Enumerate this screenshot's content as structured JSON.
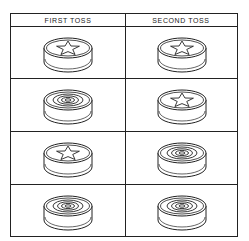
{
  "table": {
    "headers": [
      "FIRST TOSS",
      "SECOND TOSS"
    ],
    "rows": [
      {
        "first": "star",
        "second": "star"
      },
      {
        "first": "rings",
        "second": "star"
      },
      {
        "first": "star",
        "second": "rings"
      },
      {
        "first": "rings",
        "second": "rings"
      }
    ]
  },
  "colors": {
    "line": "#222222",
    "background": "#ffffff"
  }
}
